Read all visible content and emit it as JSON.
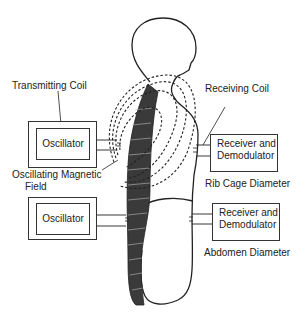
{
  "diagram": {
    "labels": {
      "transmitting_coil": "Transmitting Coil",
      "receiving_coil": "Receiving Coil",
      "oscillating_field_line1": "Oscillating Magnetic",
      "oscillating_field_line2": "Field",
      "rib_cage": "Rib Cage Diameter",
      "abdomen": "Abdomen Diameter"
    },
    "boxes": {
      "oscillator_top": "Oscillator",
      "oscillator_bottom": "Oscillator",
      "receiver_top_line1": "Receiver and",
      "receiver_top_line2": "Demodulator",
      "receiver_bottom_line1": "Receiver and",
      "receiver_bottom_line2": "Demodulator"
    },
    "colors": {
      "line": "#222222",
      "spine": "#3a3a3a"
    }
  }
}
